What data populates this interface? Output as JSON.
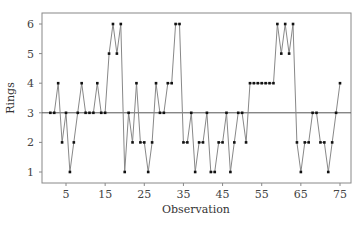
{
  "chart_data": {
    "type": "line",
    "title": "",
    "xlabel": "Observation",
    "ylabel": "Rings",
    "xlim": [
      0,
      77
    ],
    "ylim": [
      0.75,
      6.4
    ],
    "xticks": [
      5,
      15,
      25,
      35,
      45,
      55,
      65,
      75
    ],
    "yticks": [
      1,
      2,
      3,
      4,
      5,
      6
    ],
    "grid": false,
    "legend": null,
    "reference_line": {
      "y": 3,
      "label": "",
      "color": "#555555"
    },
    "x": [
      1,
      2,
      3,
      4,
      5,
      6,
      7,
      8,
      9,
      10,
      11,
      12,
      13,
      14,
      15,
      16,
      17,
      18,
      19,
      20,
      21,
      22,
      23,
      24,
      25,
      26,
      27,
      28,
      29,
      30,
      31,
      32,
      33,
      34,
      35,
      36,
      37,
      38,
      39,
      40,
      41,
      42,
      43,
      44,
      45,
      46,
      47,
      48,
      49,
      50,
      51,
      52,
      53,
      54,
      55,
      56,
      57,
      58,
      59,
      60,
      61,
      62,
      63,
      64,
      65,
      66,
      67,
      68,
      69,
      70,
      71,
      72,
      73,
      74,
      75
    ],
    "series": [
      {
        "name": "Rings",
        "color": "#888888",
        "marker_color": "#111111",
        "values": [
          3,
          3,
          4,
          2,
          3,
          1,
          2,
          3,
          4,
          3,
          3,
          3,
          4,
          3,
          3,
          5,
          6,
          5,
          6,
          1,
          3,
          2,
          4,
          2,
          2,
          1,
          2,
          4,
          3,
          3,
          4,
          4,
          6,
          6,
          2,
          2,
          3,
          1,
          2,
          2,
          3,
          1,
          1,
          2,
          2,
          3,
          1,
          2,
          3,
          3,
          2,
          4,
          4,
          4,
          4,
          4,
          4,
          4,
          6,
          5,
          6,
          5,
          6,
          2,
          1,
          2,
          2,
          3,
          3,
          2,
          2,
          1,
          2,
          3,
          4
        ]
      }
    ]
  }
}
